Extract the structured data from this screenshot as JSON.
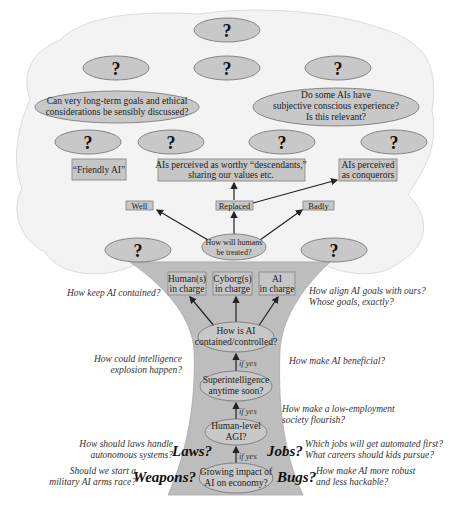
{
  "colors": {
    "canopy": "#f3f3f3",
    "trunk": "#bdbdbd",
    "node_fill": "#c8c8c8",
    "text": "#222222"
  },
  "canopy": {
    "unknown_label": "?",
    "long_term_question": [
      "Can very long-term goals and ethical",
      "considerations be sensibly discussed?"
    ],
    "consciousness_question": [
      "Do some AIs have",
      "subjective conscious experience?",
      "Is this relevant?"
    ],
    "outcomes": {
      "friendly": "“Friendly AI”",
      "descendants": [
        "AIs perceived  as  worthy “descendants,”",
        "sharing our values etc."
      ],
      "conquerors": [
        "AIs perceived",
        "as conquerors"
      ]
    },
    "treatment": {
      "well": "Well",
      "replaced": "Replaced",
      "badly": "Badly",
      "question": [
        "How will humans",
        "be treated?"
      ]
    }
  },
  "trunk": {
    "control_options": [
      [
        "Human(s)",
        "in charge"
      ],
      [
        "Cyborg(s)",
        "in charge"
      ],
      [
        "AI",
        "in charge"
      ]
    ],
    "contained": [
      "How is AI",
      "contained/controlled?"
    ],
    "superintelligence": [
      "Superintelligence",
      "anytime soon?"
    ],
    "agi": [
      "Human-level",
      "AGI?"
    ],
    "economy": [
      "Growing impact of",
      "AI on economy?"
    ],
    "if_yes": "if yes"
  },
  "side_questions": {
    "keep_contained": "How keep AI contained?",
    "align_goals": [
      "How align AI goals with ours?",
      "Whose goals, exactly?"
    ],
    "intelligence_explosion": [
      "How could intelligence",
      "explosion happen?"
    ],
    "beneficial": "How make AI beneficial?",
    "low_employment": [
      "How make a low-employment",
      "society flourish?"
    ],
    "laws_question": [
      "How should laws handle",
      "autonomous systems?"
    ],
    "jobs_question": [
      "Which jobs will get automated first?",
      "What careers should kids pursue?"
    ],
    "weapons_question": [
      "Should we start a",
      "military AI arms race?"
    ],
    "bugs_question": [
      "How make AI more robust",
      "and less hackable?"
    ]
  },
  "topics": {
    "laws": "Laws?",
    "jobs": "Jobs?",
    "weapons": "Weapons?",
    "bugs": "Bugs?"
  }
}
